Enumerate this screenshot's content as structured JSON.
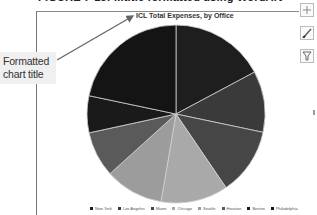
{
  "figure_caption": "FIGURE 7-15: ...title formatted using WordArt",
  "callout": {
    "line1": "Formatted",
    "line2": "chart title"
  },
  "chart": {
    "title": "ICL Total Expenses, by Office"
  },
  "chart_tools": [
    {
      "name": "chart-elements",
      "icon": "plus-icon"
    },
    {
      "name": "chart-styles",
      "icon": "brush-icon"
    },
    {
      "name": "chart-filters",
      "icon": "funnel-icon"
    }
  ],
  "chart_data": {
    "type": "pie",
    "title": "ICL Total Expenses, by Office",
    "categories": [
      "New York",
      "Los Angeles",
      "Miami",
      "Chicago",
      "Seattle",
      "Houston",
      "Boston",
      "Philadelphia"
    ],
    "values": [
      17.2,
      11.1,
      12.2,
      12.2,
      10.6,
      8.3,
      6.7,
      21.7
    ],
    "unit": "percent (estimated from slice angles)",
    "colors": [
      "#1e1e1e",
      "#3a3a3a",
      "#464646",
      "#a9a9a9",
      "#9c9c9c",
      "#5a5a5a",
      "#1a1a1a",
      "#141414"
    ],
    "legend_position": "bottom"
  },
  "legend": {
    "items": [
      {
        "label": "New York",
        "color": "#1e1e1e"
      },
      {
        "label": "Los Angeles",
        "color": "#3a3a3a"
      },
      {
        "label": "Miami",
        "color": "#464646"
      },
      {
        "label": "Chicago",
        "color": "#a9a9a9"
      },
      {
        "label": "Seattle",
        "color": "#9c9c9c"
      },
      {
        "label": "Houston",
        "color": "#5a5a5a"
      },
      {
        "label": "Boston",
        "color": "#1a1a1a"
      },
      {
        "label": "Philadelphia",
        "color": "#141414"
      }
    ]
  }
}
